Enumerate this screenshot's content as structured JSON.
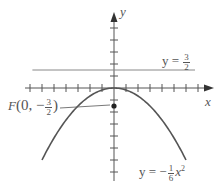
{
  "chart_data": {
    "type": "line",
    "title": "",
    "xlabel": "x",
    "ylabel": "y",
    "unit_px": 12,
    "origin_px": [
      114,
      88
    ],
    "x_ticks": [
      -7,
      -6,
      -5,
      -4,
      -3,
      -2,
      -1,
      1,
      2,
      3,
      4,
      5,
      6,
      7
    ],
    "y_ticks": [
      -7,
      -6,
      -5,
      -4,
      -3,
      -2,
      -1,
      1,
      2,
      3,
      4,
      5
    ],
    "grid": false,
    "series": [
      {
        "name": "parabola",
        "equation": "y = -1/6 x^2",
        "x_range": [
          -6,
          6
        ],
        "color": "#555555"
      },
      {
        "name": "directrix",
        "equation": "y = 3/2",
        "x_range": [
          -6.8,
          6.75
        ],
        "color": "#777777"
      }
    ],
    "points": [
      {
        "name": "focus",
        "label": "F(0, -3/2)",
        "x": 0,
        "y": -1.5
      }
    ],
    "annotations": [
      {
        "text": "y = 3/2",
        "anchor": "directrix"
      },
      {
        "text": "y = -1/6 x^2",
        "anchor": "parabola"
      },
      {
        "text": "F(0, -3/2)",
        "anchor": "focus"
      }
    ]
  },
  "labels": {
    "x_axis": "x",
    "y_axis": "y",
    "directrix_lhs": "y =",
    "directrix_num": "3",
    "directrix_den": "2",
    "parabola_lhs": "y = −",
    "parabola_num": "1",
    "parabola_den": "6",
    "parabola_var": "x",
    "parabola_exp": "2",
    "focus_F": "F",
    "focus_open": "(0, −",
    "focus_num": "3",
    "focus_den": "2",
    "focus_close": ")"
  }
}
